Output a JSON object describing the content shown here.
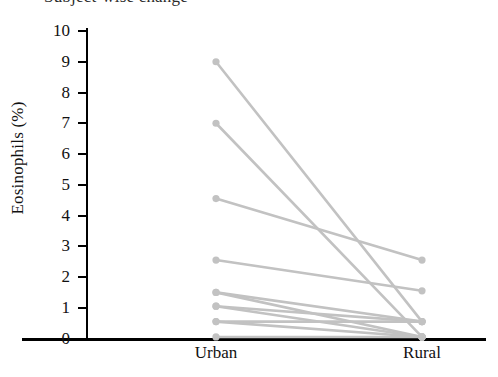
{
  "chart_data": {
    "type": "line",
    "title": "",
    "xlabel": "",
    "ylabel": "Eosinophils (%)",
    "categories": [
      "Urban",
      "Rural"
    ],
    "ylim": [
      0,
      10
    ],
    "ytick_labels": [
      "0",
      "1",
      "2",
      "3",
      "4",
      "5",
      "6",
      "7",
      "8",
      "9",
      "10"
    ],
    "ytick_values": [
      0,
      1,
      2,
      3,
      4,
      5,
      6,
      7,
      8,
      9,
      10
    ],
    "grid": false,
    "legend": false,
    "series_color": "#c2c2c2",
    "axis_color": "#000000",
    "series": [
      {
        "name": "subject-1",
        "values": [
          9.0,
          0.55
        ]
      },
      {
        "name": "subject-2",
        "values": [
          7.0,
          0.05
        ]
      },
      {
        "name": "subject-3",
        "values": [
          4.55,
          2.55
        ]
      },
      {
        "name": "subject-4",
        "values": [
          2.55,
          1.55
        ]
      },
      {
        "name": "subject-5",
        "values": [
          1.5,
          0.55
        ]
      },
      {
        "name": "subject-6",
        "values": [
          1.5,
          0.05
        ]
      },
      {
        "name": "subject-7",
        "values": [
          1.05,
          0.55
        ]
      },
      {
        "name": "subject-8",
        "values": [
          1.05,
          0.05
        ]
      },
      {
        "name": "subject-9",
        "values": [
          0.55,
          0.55
        ]
      },
      {
        "name": "subject-10",
        "values": [
          0.55,
          0.05
        ]
      },
      {
        "name": "subject-11",
        "values": [
          0.05,
          0.05
        ]
      }
    ]
  },
  "axes": {
    "y_label_text": "Eosinophils (%)",
    "x_categories": [
      "Urban",
      "Rural"
    ]
  },
  "title_clip": {
    "text": "Subject-wise change"
  }
}
